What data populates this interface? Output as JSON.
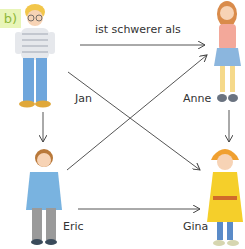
{
  "exercise": {
    "label": "b)",
    "relation_text": "ist schwerer als",
    "accent_color": "#8fb83a",
    "badge_bg": "#e8f5b8"
  },
  "people": [
    {
      "name": "Jan",
      "position": "top-left"
    },
    {
      "name": "Anne",
      "position": "top-right"
    },
    {
      "name": "Eric",
      "position": "bottom-left"
    },
    {
      "name": "Gina",
      "position": "bottom-right"
    }
  ],
  "relations": [
    {
      "from": "Jan",
      "to": "Anne",
      "label": "ist schwerer als"
    },
    {
      "from": "Jan",
      "to": "Eric"
    },
    {
      "from": "Jan",
      "to": "Gina"
    },
    {
      "from": "Eric",
      "to": "Anne"
    },
    {
      "from": "Eric",
      "to": "Gina"
    },
    {
      "from": "Anne",
      "to": "Gina"
    }
  ]
}
